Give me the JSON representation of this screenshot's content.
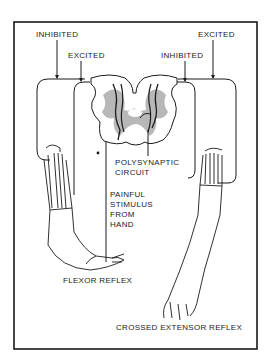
{
  "diagram": {
    "type": "flexor and crossed extensor reflex",
    "labels": {
      "inhibited_left": "INHIBITED",
      "excited_left": "EXCITED",
      "inhibited_right": "INHIBITED",
      "excited_right": "EXCITED",
      "polysynaptic": "POLYSYNAPTIC\nCIRCUIT",
      "stimulus": "PAINFUL\nSTIMULUS\nFROM\nHAND",
      "flexor_reflex": "FLEXOR REFLEX",
      "crossed_extensor_reflex": "CROSSED EXTENSOR REFLEX"
    },
    "colors": {
      "line": "#1a1a1a",
      "gray_matter": "#b8b8b8",
      "background": "#ffffff"
    }
  }
}
